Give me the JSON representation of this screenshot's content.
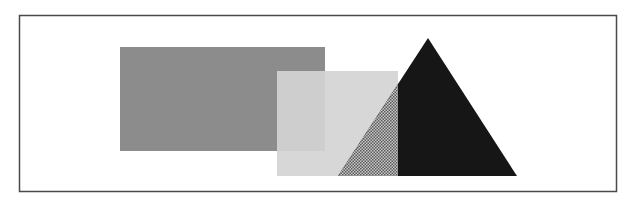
{
  "figure": {
    "colors": {
      "background": "#ffffff",
      "frame": "#4a4a4a",
      "dark_rect": "#8c8c8c",
      "light_rect": "#d4d4d4",
      "triangle": "#161616",
      "overlap_pattern_dark": "#5a5a5a",
      "overlap_pattern_light": "#c8c8c8"
    },
    "shapes": [
      {
        "name": "dark-rectangle",
        "kind": "rectangle"
      },
      {
        "name": "light-rectangle",
        "kind": "rectangle",
        "translucent": true
      },
      {
        "name": "triangle",
        "kind": "triangle"
      }
    ]
  }
}
